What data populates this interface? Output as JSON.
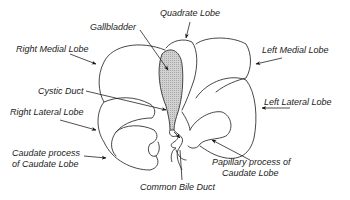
{
  "diagram": {
    "colors": {
      "stroke": "#333333",
      "gallbladder_fill": "#c8c8c8",
      "background": "#ffffff"
    },
    "labels": {
      "gallbladder": "Gallbladder",
      "quadrate_lobe": "Quadrate  Lobe",
      "right_medial_lobe": "Right Medial Lobe",
      "left_medial_lobe": "Left Medial Lobe",
      "cystic_duct": "Cystic Duct",
      "left_lateral_lobe": "Left Lateral Lobe",
      "right_lateral_lobe": "Right  Lateral Lobe",
      "caudate_process_line1": "Caudate  process",
      "caudate_process_line2": "of Caudate Lobe",
      "papillary_process_line1": "Papillary process of",
      "papillary_process_line2": "Caudate Lobe",
      "common_bile_duct": "Common Bile Duct"
    }
  }
}
